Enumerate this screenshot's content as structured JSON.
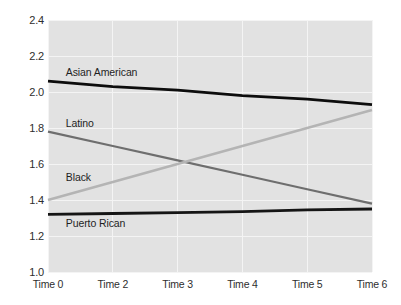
{
  "chart_data": {
    "type": "line",
    "title": "",
    "xlabel": "",
    "ylabel": "Perceived discrimination by peers",
    "x": [
      0,
      1,
      2,
      3,
      4,
      5
    ],
    "categories": [
      "Time 0",
      "Time 2",
      "Time 3",
      "Time 4",
      "Time 5",
      "Time 6"
    ],
    "ylim": [
      1.0,
      2.4
    ],
    "yticks": [
      "1.0",
      "1.2",
      "1.4",
      "1.6",
      "1.8",
      "2.0",
      "2.2",
      "2.4"
    ],
    "ytick_values": [
      1.0,
      1.2,
      1.4,
      1.6,
      1.8,
      2.0,
      2.2,
      2.4
    ],
    "grid": true,
    "legend_position": "inline-labels",
    "plot_background": "#e2e2e2",
    "series": [
      {
        "name": "Asian American",
        "color": "#0d0d0d",
        "width": 2.8,
        "values": [
          2.06,
          2.03,
          2.01,
          1.98,
          1.96,
          1.93
        ],
        "label_x_frac": 0.055,
        "label_y_value": 2.11
      },
      {
        "name": "Latino",
        "color": "#6e6e6e",
        "width": 2.2,
        "values": [
          1.78,
          1.7,
          1.62,
          1.54,
          1.46,
          1.38
        ],
        "label_x_frac": 0.055,
        "label_y_value": 1.83
      },
      {
        "name": "Black",
        "color": "#b4b4b4",
        "width": 2.4,
        "values": [
          1.4,
          1.5,
          1.6,
          1.7,
          1.8,
          1.9
        ],
        "label_x_frac": 0.055,
        "label_y_value": 1.53
      },
      {
        "name": "Puerto Rican",
        "color": "#151515",
        "width": 2.8,
        "values": [
          1.32,
          1.325,
          1.33,
          1.335,
          1.345,
          1.35
        ],
        "label_x_frac": 0.055,
        "label_y_value": 1.27
      }
    ]
  }
}
